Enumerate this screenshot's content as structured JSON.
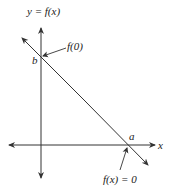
{
  "diagram": {
    "type": "linear-function-graph",
    "colors": {
      "stroke": "#333333",
      "text": "#222222",
      "background": "#ffffff"
    },
    "axes": {
      "y_label": "y = f(x)",
      "x_label": "x"
    },
    "line": {
      "description": "Decreasing straight line crossing y-axis at b and x-axis at a"
    },
    "points": {
      "y_intercept": {
        "label": "b",
        "annotation": "f(0)"
      },
      "x_intercept": {
        "label": "a",
        "annotation": "f(x) = 0"
      }
    }
  }
}
